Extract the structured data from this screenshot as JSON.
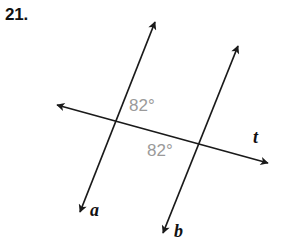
{
  "figure": {
    "problem_number": "21.",
    "canvas": {
      "width": 292,
      "height": 251,
      "background": "#ffffff"
    },
    "stroke_color": "#1a1a1a",
    "angle_label_color": "#9a9a9a",
    "lines": [
      {
        "name": "line-a",
        "label": "a",
        "role": "parallel-line",
        "from": {
          "x": 155,
          "y": 22
        },
        "to": {
          "x": 80,
          "y": 212
        },
        "arrow_start": true,
        "arrow_end": true,
        "label_position": {
          "x": 90,
          "y": 201
        }
      },
      {
        "name": "line-b",
        "label": "b",
        "role": "parallel-line",
        "from": {
          "x": 238,
          "y": 46
        },
        "to": {
          "x": 163,
          "y": 233
        },
        "arrow_start": true,
        "arrow_end": true,
        "label_position": {
          "x": 174,
          "y": 222
        }
      },
      {
        "name": "line-t",
        "label": "t",
        "role": "transversal",
        "from": {
          "x": 57,
          "y": 105
        },
        "to": {
          "x": 268,
          "y": 163
        },
        "arrow_start": true,
        "arrow_end": true,
        "label_position": {
          "x": 253,
          "y": 128
        }
      }
    ],
    "intersections": [
      {
        "name": "intersection-a-t",
        "x": 115,
        "y": 118
      },
      {
        "name": "intersection-b-t",
        "x": 200,
        "y": 143
      }
    ],
    "angles": [
      {
        "name": "angle-top",
        "value": "82°",
        "at_intersection": "intersection-a-t",
        "position": {
          "x": 129,
          "y": 97
        }
      },
      {
        "name": "angle-bottom",
        "value": "82°",
        "at_intersection": "intersection-b-t",
        "position": {
          "x": 147,
          "y": 142
        }
      }
    ]
  }
}
